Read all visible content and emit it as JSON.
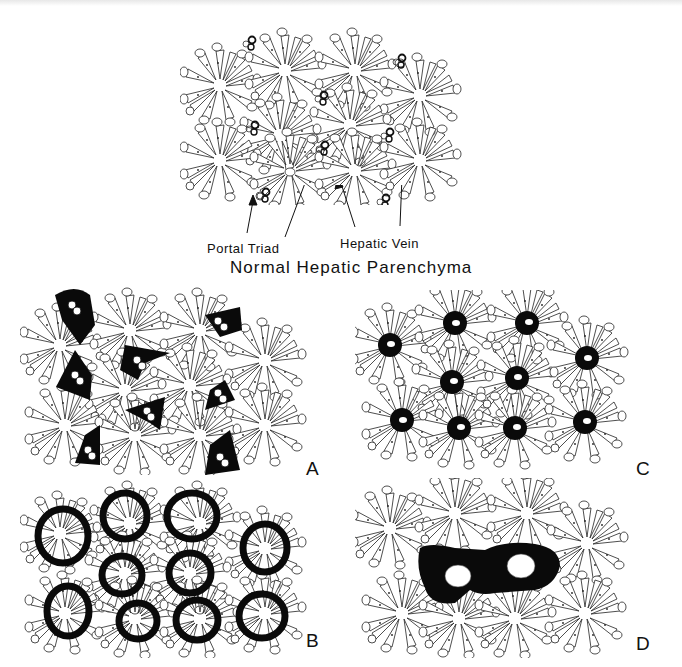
{
  "figure": {
    "title": "Normal Hepatic Parenchyma",
    "annotations": {
      "portal_triad": "Portal Triad",
      "hepatic_vein": "Hepatic Vein"
    },
    "panels": [
      {
        "id": "normal",
        "label": "",
        "description": "Normal lobular architecture: hepatocyte cords radiating from central (hepatic) veins with portal triads at periphery",
        "lobules": 12
      },
      {
        "id": "A",
        "label": "A",
        "description": "Black (fibrotic) areas surrounding portal triads, bridging between portal tracts",
        "lesions": 8
      },
      {
        "id": "B",
        "label": "B",
        "description": "Thick black rings surrounding each lobule center (perivenular/circumlobular)",
        "lesions": 11
      },
      {
        "id": "C",
        "label": "C",
        "description": "Black zones centered on hepatic (central) veins",
        "lesions": 10
      },
      {
        "id": "D",
        "label": "D",
        "description": "Confluent black bridging area linking two central veins",
        "lesions": 1
      }
    ]
  },
  "colors": {
    "ink": "#111111",
    "background": "#ffffff"
  }
}
